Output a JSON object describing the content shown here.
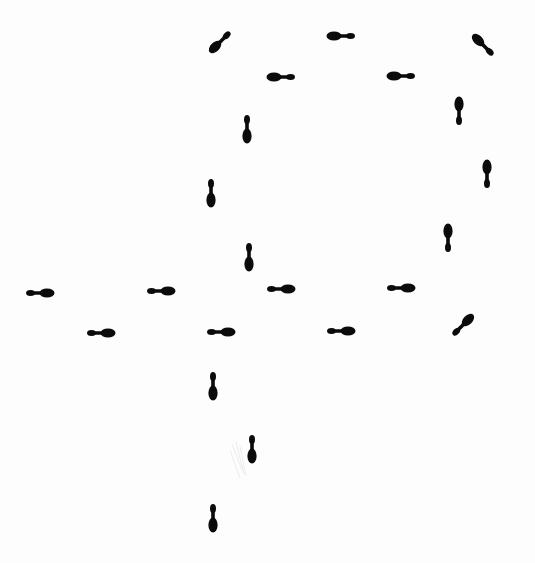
{
  "diagram": {
    "type": "footprint-step-pattern",
    "background": "#fdfdfd",
    "ink_color": "#0b0b0b",
    "footprint": {
      "length": 28,
      "ball_radius": 4.6,
      "heel_radius": 3.0,
      "waist_width": 3.6
    },
    "footprints": [
      {
        "id": 1,
        "cx": 220,
        "cy": 42,
        "angle": 135
      },
      {
        "id": 2,
        "cx": 341,
        "cy": 36,
        "angle": 180
      },
      {
        "id": 3,
        "cx": 483,
        "cy": 45,
        "angle": 225
      },
      {
        "id": 4,
        "cx": 281,
        "cy": 77,
        "angle": 180
      },
      {
        "id": 5,
        "cx": 401,
        "cy": 76,
        "angle": 180
      },
      {
        "id": 6,
        "cx": 459,
        "cy": 111,
        "angle": 270
      },
      {
        "id": 7,
        "cx": 247,
        "cy": 129,
        "angle": 90
      },
      {
        "id": 8,
        "cx": 487,
        "cy": 174,
        "angle": 270
      },
      {
        "id": 9,
        "cx": 211,
        "cy": 193,
        "angle": 90
      },
      {
        "id": 10,
        "cx": 448,
        "cy": 238,
        "angle": 270
      },
      {
        "id": 11,
        "cx": 249,
        "cy": 257,
        "angle": 90
      },
      {
        "id": 12,
        "cx": 40,
        "cy": 293,
        "angle": 0
      },
      {
        "id": 13,
        "cx": 161,
        "cy": 291,
        "angle": 0
      },
      {
        "id": 14,
        "cx": 281,
        "cy": 289,
        "angle": 0
      },
      {
        "id": 15,
        "cx": 401,
        "cy": 288,
        "angle": 0
      },
      {
        "id": 16,
        "cx": 101,
        "cy": 333,
        "angle": 0
      },
      {
        "id": 17,
        "cx": 221,
        "cy": 332,
        "angle": 0
      },
      {
        "id": 18,
        "cx": 341,
        "cy": 331,
        "angle": 0
      },
      {
        "id": 19,
        "cx": 463,
        "cy": 325,
        "angle": 315
      },
      {
        "id": 20,
        "cx": 213,
        "cy": 386,
        "angle": 90
      },
      {
        "id": 21,
        "cx": 252,
        "cy": 449,
        "angle": 90
      },
      {
        "id": 22,
        "cx": 213,
        "cy": 518,
        "angle": 90
      }
    ]
  }
}
